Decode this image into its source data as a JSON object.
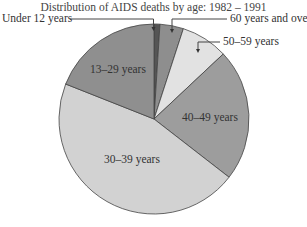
{
  "chart_data": {
    "type": "pie",
    "title": "Distribution of AIDS deaths by age: 1982 – 1991",
    "categories": [
      "Under 12 years",
      "60 years and over",
      "50–59 years",
      "40–49 years",
      "30–39 years",
      "13–29 years"
    ],
    "values": [
      1,
      4,
      8,
      22.5,
      45.5,
      19
    ],
    "unit": "percent (estimated from slice angles)",
    "colors": [
      "#555555",
      "#8e8e8e",
      "#e2e2e2",
      "#9d9d9d",
      "#d2d2d2",
      "#8f8f8f"
    ],
    "start_angle": "12 o'clock, clockwise",
    "legend": "none (leader-line labels)"
  },
  "labels": {
    "title": "Distribution of AIDS deaths by age: 1982 – 1991",
    "under12": "Under 12 years",
    "sixty_plus": "60 years and over",
    "fifty": "50–59 years",
    "forty": "40–49 years",
    "thirty": "30–39 years",
    "thirteen": "13–29 years"
  }
}
